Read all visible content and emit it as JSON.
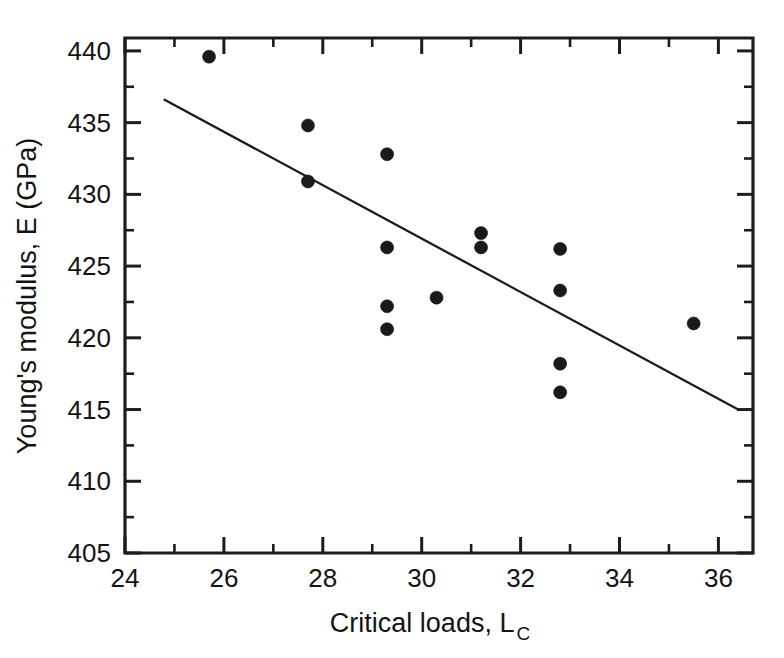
{
  "chart_data": {
    "type": "scatter",
    "title": "",
    "xlabel": "Critical loads, L",
    "xlabel_subscript": "C",
    "ylabel": "Young's modulus, E (GPa)",
    "xlim": [
      24,
      36.7
    ],
    "ylim": [
      405,
      440.9
    ],
    "grid": false,
    "legend": null,
    "x_ticks": [
      24,
      26,
      28,
      30,
      32,
      34,
      36
    ],
    "x_tick_labels": [
      "24",
      "26",
      "28",
      "30",
      "32",
      "34",
      "36"
    ],
    "x_minor_ticks": [
      25,
      27,
      29,
      31,
      33,
      35
    ],
    "y_ticks": [
      405,
      410,
      415,
      420,
      425,
      430,
      435,
      440
    ],
    "y_tick_labels": [
      "405",
      "410",
      "415",
      "420",
      "425",
      "430",
      "435",
      "440"
    ],
    "y_minor_ticks": [
      407.5,
      412.5,
      417.5,
      422.5,
      427.5,
      432.5,
      437.5
    ],
    "marker": "filled-circle",
    "marker_color": "#1a1a1a",
    "marker_size": 13,
    "points": [
      {
        "x": 25.7,
        "y": 439.6
      },
      {
        "x": 27.7,
        "y": 434.8
      },
      {
        "x": 27.7,
        "y": 430.9
      },
      {
        "x": 29.3,
        "y": 432.8
      },
      {
        "x": 29.3,
        "y": 426.3
      },
      {
        "x": 29.3,
        "y": 422.2
      },
      {
        "x": 29.3,
        "y": 420.6
      },
      {
        "x": 30.3,
        "y": 422.8
      },
      {
        "x": 31.2,
        "y": 427.3
      },
      {
        "x": 31.2,
        "y": 426.3
      },
      {
        "x": 32.8,
        "y": 426.2
      },
      {
        "x": 32.8,
        "y": 423.3
      },
      {
        "x": 32.8,
        "y": 418.2
      },
      {
        "x": 32.8,
        "y": 416.2
      },
      {
        "x": 35.5,
        "y": 421.0
      }
    ],
    "trendline": {
      "type": "linear-fit",
      "color": "#1c1c1c",
      "x_start": 24.8,
      "y_start": 436.6,
      "x_end": 36.4,
      "y_end": 415.0
    }
  }
}
